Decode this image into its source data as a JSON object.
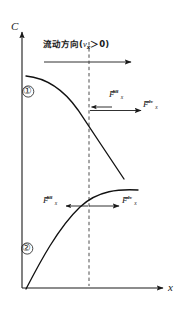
{
  "figure": {
    "title": "",
    "axes": {
      "y_label": "C",
      "x_label": "x"
    },
    "flow_annotation": {
      "text_prefix": "流动方向(",
      "variable": "v",
      "variable_subscript": "x",
      "relation": "＞0",
      "text_suffix": ")",
      "full_text": "流动方向(vₓ＞0)"
    },
    "curve_markers": [
      {
        "name": "curve-1-marker",
        "label": "①"
      },
      {
        "name": "curve-2-marker",
        "label": "②"
      }
    ],
    "force_labels": [
      {
        "name": "upper-diffusive-flux",
        "base": "F",
        "subscript": "x",
        "superscript": "diff",
        "direction": "left"
      },
      {
        "name": "upper-advective-flux",
        "base": "F",
        "subscript": "x",
        "superscript": "adv",
        "direction": "right"
      },
      {
        "name": "lower-diffusive-flux",
        "base": "F",
        "subscript": "x",
        "superscript": "diff",
        "direction": "left"
      },
      {
        "name": "lower-advective-flux",
        "base": "F",
        "subscript": "x",
        "superscript": "adv",
        "direction": "right"
      }
    ],
    "colors": {
      "ink": "#1a1a1a",
      "curve": "#111111",
      "dashed": "#444444",
      "background": "#ffffff"
    }
  },
  "chart_data": {
    "type": "line",
    "title": "",
    "xlabel": "x",
    "ylabel": "C",
    "grid": false,
    "legend": false,
    "annotations": [
      "流动方向(vₓ＞0)",
      "F_x^diff",
      "F_x^adv",
      "①",
      "②"
    ],
    "reference_line": {
      "orientation": "vertical",
      "style": "dashed",
      "x_pixel": 89
    },
    "series": [
      {
        "name": "①",
        "description": "decreasing concave-down concentration profile",
        "points": [
          [
            26,
            76
          ],
          [
            40,
            79
          ],
          [
            54,
            86
          ],
          [
            66,
            96
          ],
          [
            78,
            110
          ],
          [
            89,
            124
          ],
          [
            100,
            140
          ],
          [
            110,
            155
          ],
          [
            118,
            167
          ],
          [
            124,
            178
          ]
        ]
      },
      {
        "name": "②",
        "description": "increasing concave-down concentration profile",
        "points": [
          [
            26,
            288
          ],
          [
            34,
            272
          ],
          [
            44,
            254
          ],
          [
            54,
            238
          ],
          [
            64,
            224
          ],
          [
            75,
            211
          ],
          [
            89,
            200
          ],
          [
            104,
            195
          ],
          [
            120,
            192
          ],
          [
            137,
            191
          ]
        ]
      }
    ]
  }
}
